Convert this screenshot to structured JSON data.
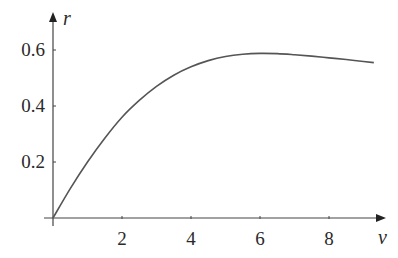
{
  "chart_data": {
    "type": "line",
    "title": "",
    "xlabel": "v",
    "ylabel": "r",
    "xlim": [
      0,
      9.5
    ],
    "ylim": [
      0,
      0.65
    ],
    "grid": false,
    "legend": null,
    "x_ticks": [
      2,
      4,
      6,
      8
    ],
    "x_tick_labels": [
      "2",
      "4",
      "6",
      "8"
    ],
    "y_ticks": [
      0.2,
      0.4,
      0.6
    ],
    "y_tick_labels": [
      "0.2",
      "0.4",
      "0.6"
    ],
    "series": [
      {
        "name": "r(v)",
        "color": "#555555",
        "x": [
          0,
          0.5,
          1,
          1.5,
          2,
          2.5,
          3,
          3.5,
          4,
          4.5,
          5,
          5.5,
          6,
          6.5,
          7,
          7.5,
          8,
          8.5,
          9,
          9.3
        ],
        "values": [
          0,
          0.105,
          0.2,
          0.285,
          0.36,
          0.42,
          0.47,
          0.51,
          0.54,
          0.562,
          0.577,
          0.585,
          0.588,
          0.587,
          0.583,
          0.578,
          0.572,
          0.566,
          0.559,
          0.555
        ]
      }
    ]
  },
  "axes": {
    "x_label": "v",
    "y_label": "r",
    "axis_color": "#444444"
  }
}
